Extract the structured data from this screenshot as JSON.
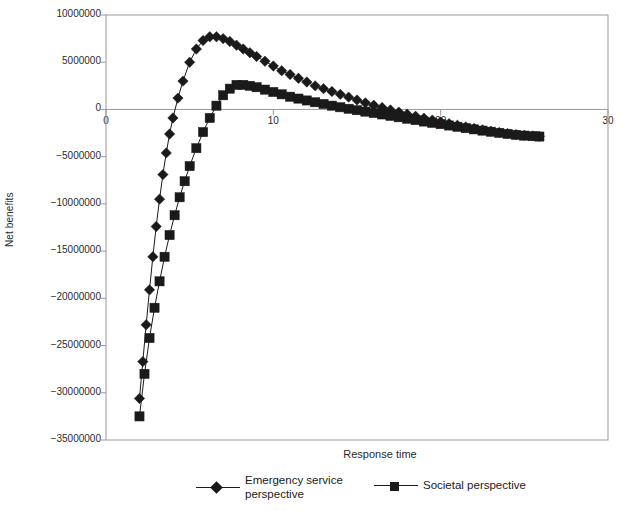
{
  "chart_data": {
    "type": "line",
    "title": "",
    "xlabel": "Response time",
    "ylabel": "Net benefits",
    "xlim": [
      0,
      30
    ],
    "ylim": [
      -35000000,
      10000000
    ],
    "xticks": [
      0,
      10,
      20,
      30
    ],
    "xtick_labels": [
      "0",
      "10",
      "20",
      "30"
    ],
    "yticks": [
      10000000,
      5000000,
      0,
      -5000000,
      -10000000,
      -15000000,
      -20000000,
      -25000000,
      -30000000,
      -35000000
    ],
    "ytick_labels": [
      "10000000",
      "5000000",
      "0",
      "-5000000",
      "-10000000",
      "-15000000",
      "-20000000",
      "-25000000",
      "-30000000",
      "-35000000"
    ],
    "grid": false,
    "legend_position": "bottom",
    "series": [
      {
        "name": "Emergency service perspective",
        "marker": "diamond",
        "color": "#1a1a1a",
        "x": [
          2.0,
          2.2,
          2.4,
          2.6,
          2.8,
          3.0,
          3.2,
          3.4,
          3.6,
          3.8,
          4.0,
          4.3,
          4.6,
          5.0,
          5.4,
          5.8,
          6.2,
          6.6,
          7.0,
          7.4,
          7.8,
          8.2,
          8.6,
          9.0,
          9.5,
          10.0,
          10.5,
          11.0,
          11.5,
          12.0,
          12.5,
          13.0,
          13.5,
          14.0,
          14.5,
          15.0,
          15.5,
          16.0,
          16.5,
          17.0,
          17.5,
          18.0,
          18.5,
          19.0,
          19.5,
          20.0,
          20.5,
          21.0,
          21.5,
          22.0,
          22.5,
          23.0,
          23.5,
          24.0,
          24.5,
          25.0,
          25.5,
          25.9
        ],
        "y": [
          -30600000,
          -26700000,
          -22800000,
          -19100000,
          -15600000,
          -12400000,
          -9500000,
          -6900000,
          -4600000,
          -2600000,
          -900000,
          1200000,
          3000000,
          5000000,
          6400000,
          7300000,
          7700000,
          7700000,
          7500000,
          7200000,
          6800000,
          6400000,
          6000000,
          5600000,
          5100000,
          4600000,
          4100000,
          3700000,
          3300000,
          2900000,
          2500000,
          2200000,
          1900000,
          1600000,
          1300000,
          1000000,
          700000,
          450000,
          200000,
          -50000,
          -280000,
          -500000,
          -720000,
          -930000,
          -1130000,
          -1320000,
          -1500000,
          -1680000,
          -1850000,
          -2010000,
          -2160000,
          -2300000,
          -2430000,
          -2550000,
          -2660000,
          -2740000,
          -2800000,
          -2840000
        ]
      },
      {
        "name": "Societal perspective",
        "marker": "square",
        "color": "#1a1a1a",
        "x": [
          2.0,
          2.3,
          2.6,
          2.9,
          3.2,
          3.5,
          3.8,
          4.1,
          4.4,
          4.7,
          5.0,
          5.4,
          5.8,
          6.2,
          6.6,
          7.0,
          7.4,
          7.8,
          8.2,
          8.6,
          9.0,
          9.5,
          10.0,
          10.5,
          11.0,
          11.5,
          12.0,
          12.5,
          13.0,
          13.5,
          14.0,
          14.5,
          15.0,
          15.5,
          16.0,
          16.5,
          17.0,
          17.5,
          18.0,
          18.5,
          19.0,
          19.5,
          20.0,
          20.5,
          21.0,
          21.5,
          22.0,
          22.5,
          23.0,
          23.5,
          24.0,
          24.5,
          25.0,
          25.5,
          25.9
        ],
        "y": [
          -32500000,
          -28000000,
          -24200000,
          -21000000,
          -18200000,
          -15600000,
          -13300000,
          -11200000,
          -9300000,
          -7600000,
          -6000000,
          -4100000,
          -2400000,
          -900000,
          400000,
          1500000,
          2200000,
          2600000,
          2600000,
          2500000,
          2350000,
          2100000,
          1850000,
          1600000,
          1350000,
          1150000,
          950000,
          760000,
          580000,
          400000,
          230000,
          70000,
          -80000,
          -230000,
          -380000,
          -530000,
          -680000,
          -830000,
          -980000,
          -1130000,
          -1280000,
          -1420000,
          -1560000,
          -1700000,
          -1840000,
          -1980000,
          -2110000,
          -2240000,
          -2360000,
          -2480000,
          -2590000,
          -2690000,
          -2770000,
          -2830000,
          -2870000
        ]
      }
    ]
  },
  "axes": {
    "ylabel": "Net benefits",
    "xlabel": "Response time"
  },
  "legend": {
    "items": [
      {
        "label_line1": "Emergency service",
        "label_line2": "perspective",
        "marker": "diamond-marker"
      },
      {
        "label_line1": "Societal perspective",
        "label_line2": "",
        "marker": "square-marker"
      }
    ]
  }
}
